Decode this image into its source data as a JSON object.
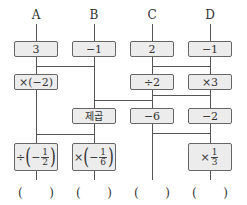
{
  "columns": [
    {
      "label": "A",
      "x": 36
    },
    {
      "label": "B",
      "x": 94
    },
    {
      "label": "C",
      "x": 152
    },
    {
      "label": "D",
      "x": 210
    }
  ],
  "boxes": {
    "A": {
      "start": "3",
      "op1": "×(−2)",
      "op_final_sym": "÷",
      "op_final_num": "1",
      "op_final_den": "2",
      "op_final_sign": "−"
    },
    "B": {
      "start": "−1",
      "op_square": "제곱",
      "op_final_sym": "×",
      "op_final_num": "1",
      "op_final_den": "6",
      "op_final_sign": "−"
    },
    "C": {
      "start": "2",
      "op1": "÷2",
      "op2": "−6"
    },
    "D": {
      "start": "−1",
      "op1": "×3",
      "op2": "−2",
      "op_final_sym": "×",
      "op_final_num": "1",
      "op_final_den": "3"
    }
  },
  "answers": {
    "open": "(",
    "close": ")"
  },
  "colors": {
    "box_fill": "#ececec",
    "box_border": "#666666",
    "line": "#555555"
  }
}
